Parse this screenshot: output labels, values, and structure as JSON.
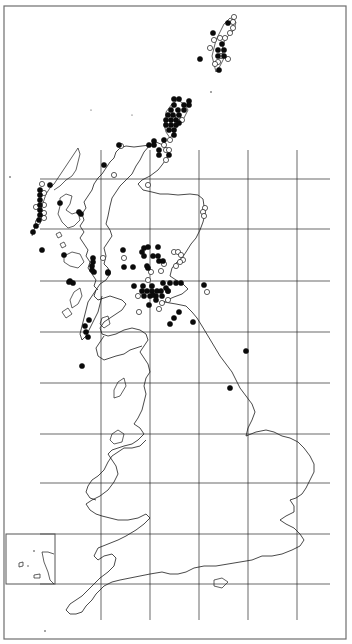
{
  "map": {
    "type": "species distribution dot map",
    "region": "Great Britain",
    "width": 352,
    "height": 644,
    "frame": {
      "x": 4,
      "y": 6,
      "w": 342,
      "h": 633
    },
    "grid": {
      "description": "100 km national grid squares",
      "vertical_x": [
        101,
        150,
        199,
        248,
        297
      ],
      "horizontal_y": [
        179,
        229,
        281,
        332,
        383,
        434,
        483,
        534,
        584
      ]
    },
    "inset": {
      "x": 6,
      "y": 534,
      "w": 49,
      "h": 50,
      "label": "Channel Islands"
    },
    "legend": {
      "filled_circle": "present (recent records)",
      "open_circle": "older / unconfirmed records"
    },
    "colors": {
      "coast": "#1c1c1c",
      "grid": "#2a2a2a",
      "frame": "#6e6e6e",
      "dot_fill": "#0a0a0a",
      "background": "#ffffff"
    },
    "dot_radius": 2.6,
    "filled_dots": [
      [
        228,
        23
      ],
      [
        213,
        33
      ],
      [
        222,
        44
      ],
      [
        218,
        50
      ],
      [
        224,
        50
      ],
      [
        218,
        56
      ],
      [
        224,
        56
      ],
      [
        200,
        59
      ],
      [
        219,
        70
      ],
      [
        174,
        99
      ],
      [
        179,
        99
      ],
      [
        189,
        101
      ],
      [
        174,
        105
      ],
      [
        184,
        105
      ],
      [
        189,
        105
      ],
      [
        171,
        110
      ],
      [
        178,
        110
      ],
      [
        184,
        110
      ],
      [
        168,
        115
      ],
      [
        173,
        115
      ],
      [
        179,
        115
      ],
      [
        166,
        120
      ],
      [
        171,
        120
      ],
      [
        176,
        120
      ],
      [
        166,
        125
      ],
      [
        171,
        125
      ],
      [
        176,
        125
      ],
      [
        179,
        123
      ],
      [
        169,
        130
      ],
      [
        174,
        130
      ],
      [
        174,
        135
      ],
      [
        154,
        141
      ],
      [
        154,
        145
      ],
      [
        149,
        145
      ],
      [
        164,
        140
      ],
      [
        159,
        150
      ],
      [
        159,
        155
      ],
      [
        169,
        155
      ],
      [
        119,
        145
      ],
      [
        104,
        165
      ],
      [
        50,
        185
      ],
      [
        40,
        190
      ],
      [
        40,
        195
      ],
      [
        40,
        200
      ],
      [
        40,
        205
      ],
      [
        40,
        210
      ],
      [
        40,
        215
      ],
      [
        39,
        220
      ],
      [
        36,
        226
      ],
      [
        33,
        232
      ],
      [
        60,
        203
      ],
      [
        79,
        212
      ],
      [
        81,
        214
      ],
      [
        42,
        250
      ],
      [
        64,
        255
      ],
      [
        123,
        250
      ],
      [
        144,
        248
      ],
      [
        142,
        252
      ],
      [
        144,
        256
      ],
      [
        124,
        267
      ],
      [
        133,
        267
      ],
      [
        148,
        268
      ],
      [
        159,
        261
      ],
      [
        163,
        261
      ],
      [
        204,
        285
      ],
      [
        148,
        247
      ],
      [
        158,
        247
      ],
      [
        153,
        256
      ],
      [
        158,
        256
      ],
      [
        93,
        258
      ],
      [
        93,
        262
      ],
      [
        92,
        266
      ],
      [
        92,
        270
      ],
      [
        94,
        272
      ],
      [
        69,
        282
      ],
      [
        73,
        283
      ],
      [
        134,
        286
      ],
      [
        143,
        286
      ],
      [
        152,
        286
      ],
      [
        142,
        291
      ],
      [
        147,
        291
      ],
      [
        152,
        291
      ],
      [
        157,
        291
      ],
      [
        161,
        291
      ],
      [
        144,
        296
      ],
      [
        150,
        296
      ],
      [
        156,
        296
      ],
      [
        162,
        296
      ],
      [
        163,
        283
      ],
      [
        166,
        288
      ],
      [
        170,
        283
      ],
      [
        176,
        283
      ],
      [
        181,
        283
      ],
      [
        168,
        291
      ],
      [
        156,
        300
      ],
      [
        153,
        295
      ],
      [
        149,
        305
      ],
      [
        193,
        322
      ],
      [
        179,
        312
      ],
      [
        174,
        318
      ],
      [
        170,
        324
      ],
      [
        108,
        272
      ],
      [
        89,
        320
      ],
      [
        85,
        326
      ],
      [
        86,
        332
      ],
      [
        88,
        337
      ],
      [
        82,
        366
      ],
      [
        246,
        351
      ],
      [
        230,
        388
      ],
      [
        108,
        273
      ],
      [
        70,
        281
      ],
      [
        147,
        266
      ]
    ],
    "open_dots": [
      [
        234,
        17
      ],
      [
        233,
        22
      ],
      [
        233,
        28
      ],
      [
        230,
        33
      ],
      [
        225,
        38
      ],
      [
        220,
        38
      ],
      [
        214,
        40
      ],
      [
        210,
        48
      ],
      [
        228,
        59
      ],
      [
        218,
        62
      ],
      [
        215,
        64
      ],
      [
        221,
        56
      ],
      [
        178,
        117
      ],
      [
        182,
        120
      ],
      [
        170,
        140
      ],
      [
        164,
        145
      ],
      [
        166,
        150
      ],
      [
        169,
        150
      ],
      [
        166,
        160
      ],
      [
        121,
        146
      ],
      [
        114,
        175
      ],
      [
        148,
        185
      ],
      [
        205,
        208
      ],
      [
        203,
        212
      ],
      [
        204,
        216
      ],
      [
        174,
        252
      ],
      [
        178,
        252
      ],
      [
        181,
        255
      ],
      [
        183,
        260
      ],
      [
        180,
        262
      ],
      [
        164,
        264
      ],
      [
        176,
        266
      ],
      [
        168,
        291
      ],
      [
        124,
        258
      ],
      [
        151,
        272
      ],
      [
        138,
        296
      ],
      [
        139,
        312
      ],
      [
        143,
        292
      ],
      [
        162,
        303
      ],
      [
        148,
        280
      ],
      [
        168,
        300
      ],
      [
        103,
        258
      ],
      [
        44,
        193
      ],
      [
        44,
        205
      ],
      [
        44,
        213
      ],
      [
        44,
        218
      ],
      [
        38,
        222
      ],
      [
        36,
        207
      ],
      [
        42,
        184
      ],
      [
        207,
        292
      ],
      [
        159,
        309
      ],
      [
        161,
        271
      ]
    ]
  }
}
